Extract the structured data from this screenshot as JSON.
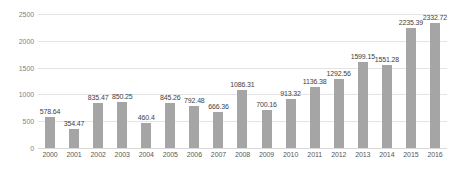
{
  "chart_data": {
    "type": "bar",
    "title": "",
    "subtitle": "",
    "xlabel": "",
    "ylabel": "",
    "categories": [
      "2000",
      "2001",
      "2002",
      "2003",
      "2004",
      "2005",
      "2006",
      "2007",
      "2008",
      "2009",
      "2010",
      "2011",
      "2012",
      "2013",
      "2014",
      "2015",
      "2016"
    ],
    "values": [
      578.64,
      354.47,
      835.47,
      850.25,
      460.4,
      845.26,
      792.48,
      666.36,
      1086.31,
      700.16,
      913.32,
      1136.38,
      1292.56,
      1599.15,
      1551.28,
      2235.39,
      2332.72
    ],
    "data_labels": [
      "578.64",
      "354.47",
      "835.47",
      "850.25",
      "460.4",
      "845.26",
      "792.48",
      "666.36",
      "1086.31",
      "700.16",
      "913.32",
      "1136.38",
      "1292.56",
      "1599.15",
      "1551.28",
      "2235.39",
      "2332.72"
    ],
    "ylim": [
      0,
      2500
    ],
    "yticks": [
      0,
      500,
      1000,
      1500,
      2000,
      2500
    ],
    "ytick_labels": [
      "0",
      "500",
      "1000",
      "1500",
      "2000",
      "2500"
    ],
    "grid": true,
    "legend": "none",
    "series": [
      {
        "name": "",
        "color": "#a5a5a5",
        "values": [
          578.64,
          354.47,
          835.47,
          850.25,
          460.4,
          845.26,
          792.48,
          666.36,
          1086.31,
          700.16,
          913.32,
          1136.38,
          1292.56,
          1599.15,
          1551.28,
          2235.39,
          2332.72
        ]
      }
    ]
  },
  "colors": {
    "bar": "#a5a5a5",
    "gridline": "#e4e4e4",
    "axis_line": "#d9d9d9",
    "tick_text": "#808080",
    "label_text": "#3f3f3f",
    "background": "#ffffff"
  }
}
